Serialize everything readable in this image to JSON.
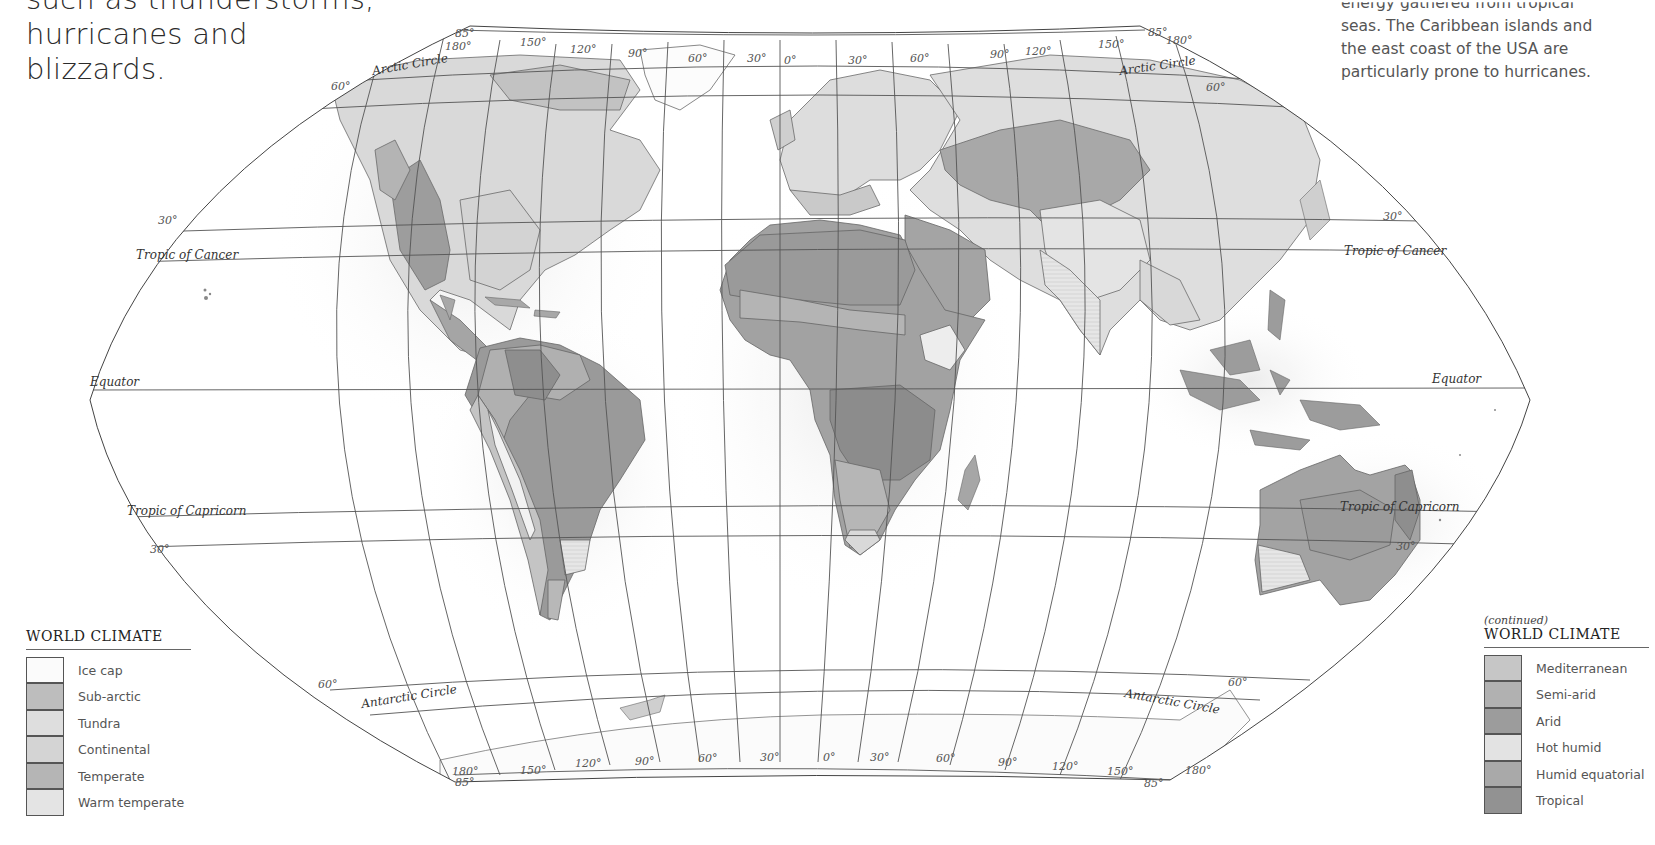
{
  "intro_left": {
    "lines": [
      "such as thunderstorms,",
      "hurricanes and",
      "blizzards."
    ]
  },
  "intro_right": {
    "lines": [
      "energy gathered from tropical",
      "seas. The Caribbean islands and",
      "the east coast of the USA are",
      "particularly prone to hurricanes."
    ]
  },
  "map": {
    "title": "World climate map",
    "parallels": {
      "arctic_circle": "Arctic Circle",
      "tropic_cancer": "Tropic of Cancer",
      "equator": "Equator",
      "tropic_capricorn": "Tropic of Capricorn",
      "antarctic_circle": "Antarctic Circle"
    },
    "lat_labels": {
      "n60": "60°",
      "n30": "30°",
      "s30": "30°",
      "s60": "60°",
      "n85": "85°",
      "s85": "85°"
    },
    "lon_labels_top": [
      "180°",
      "150°",
      "120°",
      "90°",
      "60°",
      "30°",
      "0°",
      "30°",
      "60°",
      "90°",
      "120°",
      "150°",
      "180°"
    ],
    "lon_labels_bottom": [
      "180°",
      "150°",
      "120°",
      "90°",
      "60°",
      "30°",
      "0°",
      "30°",
      "60°",
      "90°",
      "120°",
      "150°",
      "180°"
    ],
    "colors": {
      "ocean": "#ffffff",
      "graticule": "#555555",
      "ice_cap": "#fbfbfb",
      "sub_arctic": "#bdbdbd",
      "tundra": "#dcdcdc",
      "continental": "#d6d6d6",
      "temperate": "#b4b4b4",
      "warm_temperate": "#e2e2e2",
      "mediterranean": "#c8c8c8",
      "semi_arid": "#a9a9a9",
      "arid": "#9a9a9a",
      "hot_humid": "#e6e6e6",
      "humid_equatorial": "#a8a8a8",
      "tropical": "#8f8f8f"
    }
  },
  "legend_left": {
    "title": "WORLD CLIMATE",
    "items": [
      {
        "label": "Ice cap",
        "color": "#fbfbfb"
      },
      {
        "label": "Sub-arctic",
        "color": "#bdbdbd"
      },
      {
        "label": "Tundra",
        "color": "#dedede"
      },
      {
        "label": "Continental",
        "color": "#d4d4d4"
      },
      {
        "label": "Temperate",
        "color": "#b5b5b5"
      },
      {
        "label": "Warm temperate",
        "color": "#e4e4e4"
      }
    ]
  },
  "legend_right": {
    "continued": "(continued)",
    "title": "WORLD CLIMATE",
    "items": [
      {
        "label": "Mediterranean",
        "color": "#c6c6c6"
      },
      {
        "label": "Semi-arid",
        "color": "#b1b1b1"
      },
      {
        "label": "Arid",
        "color": "#9c9c9c"
      },
      {
        "label": "Hot humid",
        "color": "#e3e3e3"
      },
      {
        "label": "Humid equatorial",
        "color": "#a9a9a9"
      },
      {
        "label": "Tropical",
        "color": "#929292"
      }
    ]
  }
}
